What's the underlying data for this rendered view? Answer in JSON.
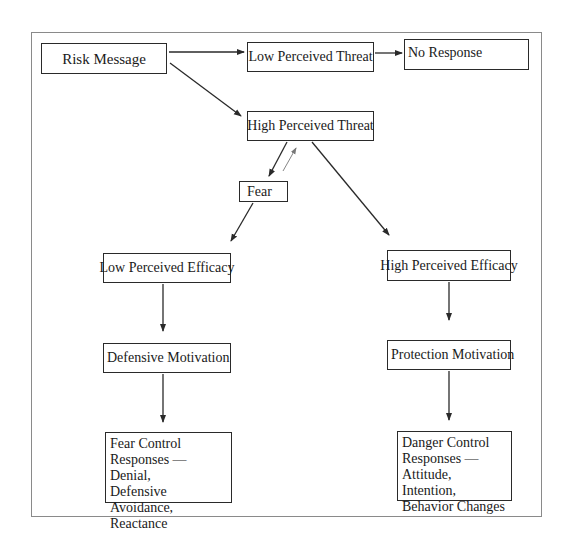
{
  "diagram": {
    "type": "flowchart",
    "title": "",
    "nodes": {
      "risk_message": "Risk Message",
      "low_threat": "Low Perceived Threat",
      "no_response": "No Response",
      "high_threat": "High Perceived Threat",
      "fear": "Fear",
      "low_efficacy": "Low Perceived Efficacy",
      "high_efficacy": "High Perceived Efficacy",
      "defensive_motivation": "Defensive Motivation",
      "protection_motivation": "Protection Motivation",
      "fear_control": "Fear Control Responses — Denial, Defensive Avoidance, Reactance",
      "danger_control": "Danger Control Responses — Attitude, Intention, Behavior Changes"
    },
    "fear_control_lines": [
      "Fear Control",
      "Responses — Denial,",
      "Defensive Avoidance,",
      "Reactance"
    ],
    "danger_control_lines": [
      "Danger Control",
      "Responses —",
      "Attitude, Intention,",
      "Behavior Changes"
    ],
    "edges": [
      {
        "from": "Risk Message",
        "to": "Low Perceived Threat"
      },
      {
        "from": "Risk Message",
        "to": "High Perceived Threat"
      },
      {
        "from": "Low Perceived Threat",
        "to": "No Response"
      },
      {
        "from": "High Perceived Threat",
        "to": "Fear"
      },
      {
        "from": "Fear",
        "to": "High Perceived Threat",
        "style": "thin"
      },
      {
        "from": "High Perceived Threat",
        "to": "High Perceived Efficacy"
      },
      {
        "from": "Fear",
        "to": "Low Perceived Efficacy"
      },
      {
        "from": "Low Perceived Efficacy",
        "to": "Defensive Motivation"
      },
      {
        "from": "Defensive Motivation",
        "to": "Fear Control Responses"
      },
      {
        "from": "High Perceived Efficacy",
        "to": "Protection Motivation"
      },
      {
        "from": "Protection Motivation",
        "to": "Danger Control Responses"
      }
    ],
    "colors": {
      "line": "#2a2a2a",
      "frame": "#8a8a8a",
      "background": "#ffffff"
    }
  }
}
